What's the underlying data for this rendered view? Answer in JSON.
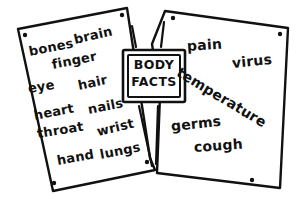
{
  "scene": {
    "title": "Body Facts word cards",
    "background_color": "#ffffff",
    "ink_color": "#111111",
    "style": "hand-drawn black ink sketch on white"
  },
  "center_label": {
    "name": "body-facts-label",
    "line1": "BODY",
    "line2": "FACTS",
    "border_style": "double-rectangle"
  },
  "cards": [
    {
      "id": "left-card",
      "name": "word-card-left",
      "rotation_deg": -4,
      "pin_dots": 4,
      "words": [
        {
          "text": "bones",
          "x": 29,
          "y": 45,
          "rot": -11,
          "size": 13
        },
        {
          "text": "brain",
          "x": 74,
          "y": 33,
          "rot": -13,
          "size": 13
        },
        {
          "text": "finger",
          "x": 52,
          "y": 58,
          "rot": -11,
          "size": 13
        },
        {
          "text": "eye",
          "x": 28,
          "y": 82,
          "rot": -9,
          "size": 13
        },
        {
          "text": "hair",
          "x": 78,
          "y": 79,
          "rot": -12,
          "size": 13
        },
        {
          "text": "heart",
          "x": 34,
          "y": 109,
          "rot": -11,
          "size": 13
        },
        {
          "text": "nails",
          "x": 88,
          "y": 103,
          "rot": -11,
          "size": 13
        },
        {
          "text": "throat",
          "x": 37,
          "y": 127,
          "rot": -9,
          "size": 13
        },
        {
          "text": "wrist",
          "x": 97,
          "y": 125,
          "rot": -13,
          "size": 13
        },
        {
          "text": "hand",
          "x": 57,
          "y": 154,
          "rot": -10,
          "size": 13
        },
        {
          "text": "lungs",
          "x": 100,
          "y": 148,
          "rot": -11,
          "size": 13
        }
      ]
    },
    {
      "id": "right-card",
      "name": "word-card-right",
      "rotation_deg": 3,
      "pin_dots": 4,
      "words": [
        {
          "text": "pain",
          "x": 187,
          "y": 39,
          "rot": -4,
          "size": 14
        },
        {
          "text": "virus",
          "x": 232,
          "y": 56,
          "rot": -6,
          "size": 14
        },
        {
          "text": "temperature",
          "x": 178,
          "y": 64,
          "rot": 31,
          "size": 14
        },
        {
          "text": "germs",
          "x": 171,
          "y": 119,
          "rot": -6,
          "size": 14
        },
        {
          "text": "cough",
          "x": 194,
          "y": 140,
          "rot": -4,
          "size": 14
        }
      ]
    }
  ],
  "word_list_all": [
    "bones",
    "brain",
    "finger",
    "eye",
    "hair",
    "heart",
    "nails",
    "throat",
    "wrist",
    "hand",
    "lungs",
    "pain",
    "virus",
    "temperature",
    "germs",
    "cough"
  ]
}
